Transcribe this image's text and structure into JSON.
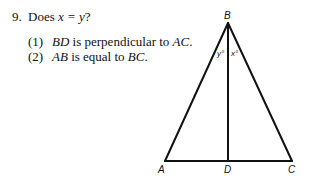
{
  "question": {
    "number": "9.",
    "stem_prefix": "Does ",
    "stem_expr": "x = y",
    "stem_suffix": "?",
    "statements": [
      {
        "num": "(1)",
        "seg1": "BD",
        "text": " is perpendicular to ",
        "seg2": "AC",
        "end": "."
      },
      {
        "num": "(2)",
        "seg1": "AB",
        "text": " is equal to ",
        "seg2": "BC",
        "end": "."
      }
    ]
  },
  "figure": {
    "type": "triangle",
    "points": {
      "A": "A",
      "B": "B",
      "C": "C",
      "D": "D"
    },
    "angles": {
      "left": "y°",
      "right": "x°"
    },
    "stroke_color": "#111111"
  }
}
